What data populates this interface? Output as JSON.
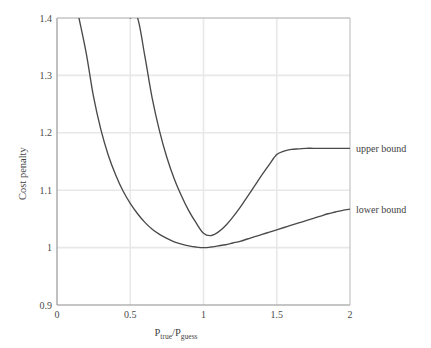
{
  "chart_data": {
    "type": "line",
    "title": "",
    "xlabel": "P_true/P_guess",
    "xlabel_base": "P",
    "xlabel_sub1": "true",
    "xlabel_mid": "/P",
    "xlabel_sub2": "guess",
    "ylabel": "Cost penalty",
    "xlim": [
      0,
      2
    ],
    "ylim": [
      0.9,
      1.4
    ],
    "xticks": [
      "0",
      "0.5",
      "1",
      "1.5",
      "2"
    ],
    "xtick_values": [
      0,
      0.5,
      1,
      1.5,
      2
    ],
    "yticks": [
      "0.9",
      "1",
      "1.1",
      "1.2",
      "1.3",
      "1.4"
    ],
    "ytick_values": [
      0.9,
      1.0,
      1.1,
      1.2,
      1.3,
      1.4
    ],
    "grid": true,
    "legend_position": "right-inline-annotations",
    "line_color": "#4a4a4a",
    "grid_color": "#e8e8e8",
    "axis_color": "#9a9a9a",
    "series": [
      {
        "name": "upper bound",
        "label": "upper bound",
        "annotation_at": {
          "x": 2,
          "y": 1.173
        },
        "x": [
          0.5,
          0.55,
          0.6,
          0.65,
          0.7,
          0.75,
          0.8,
          0.85,
          0.9,
          0.95,
          1.0,
          1.05,
          1.1,
          1.15,
          1.2,
          1.25,
          1.3,
          1.35,
          1.4,
          1.45,
          1.5,
          1.55,
          1.6,
          1.65,
          1.7,
          1.75,
          1.8,
          1.85,
          1.9,
          1.95,
          2.0
        ],
        "y": [
          1.556,
          1.429,
          1.333,
          1.26,
          1.203,
          1.157,
          1.12,
          1.09,
          1.064,
          1.043,
          1.025,
          1.021,
          1.027,
          1.038,
          1.053,
          1.07,
          1.089,
          1.108,
          1.127,
          1.145,
          1.162,
          1.168,
          1.171,
          1.172,
          1.173,
          1.173,
          1.173,
          1.173,
          1.173,
          1.173,
          1.173
        ]
      },
      {
        "name": "lower bound",
        "label": "lower bound",
        "annotation_at": {
          "x": 2,
          "y": 1.067
        },
        "x": [
          0.15,
          0.2,
          0.25,
          0.3,
          0.35,
          0.4,
          0.45,
          0.5,
          0.55,
          0.6,
          0.65,
          0.7,
          0.75,
          0.8,
          0.85,
          0.9,
          0.95,
          1.0,
          1.05,
          1.1,
          1.15,
          1.2,
          1.25,
          1.3,
          1.35,
          1.4,
          1.45,
          1.5,
          1.55,
          1.6,
          1.65,
          1.7,
          1.75,
          1.8,
          1.85,
          1.9,
          1.95,
          2.0
        ],
        "y": [
          1.45,
          1.338,
          1.262,
          1.205,
          1.161,
          1.127,
          1.099,
          1.077,
          1.059,
          1.044,
          1.032,
          1.023,
          1.016,
          1.01,
          1.006,
          1.003,
          1.001,
          1.0,
          1.001,
          1.003,
          1.005,
          1.008,
          1.011,
          1.015,
          1.019,
          1.023,
          1.027,
          1.031,
          1.035,
          1.039,
          1.043,
          1.047,
          1.051,
          1.055,
          1.059,
          1.062,
          1.065,
          1.067
        ]
      }
    ]
  },
  "annotations": {
    "upper_bound": "upper bound",
    "lower_bound": "lower bound"
  }
}
